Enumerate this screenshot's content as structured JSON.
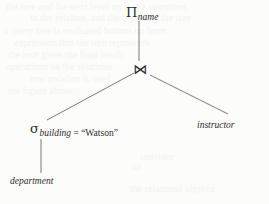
{
  "figure": {
    "kind": "relational-algebra-expression-tree",
    "ink_color": "#2e2e2e",
    "background_color": "#fcfcfb",
    "bleed_color": "#f4f4f2"
  },
  "nodes": {
    "project": {
      "symbol": "Π",
      "symbol_name": "pi-projection-symbol",
      "subscript": "name"
    },
    "join": {
      "symbol": "⋈",
      "symbol_name": "bowtie-natural-join-symbol",
      "subscript": ""
    },
    "select": {
      "symbol": "σ",
      "symbol_name": "sigma-selection-symbol",
      "subscript_attribute": "building",
      "subscript_operator": " = ",
      "subscript_value": "“Watson”"
    },
    "relation_instructor": {
      "label": "instructor"
    },
    "relation_department": {
      "label": "department"
    }
  },
  "edges": [
    {
      "name": "edge-project-to-join",
      "x1": 139,
      "y1": 21,
      "x2": 139,
      "y2": 61
    },
    {
      "name": "edge-join-to-select",
      "x1": 134,
      "y1": 73,
      "x2": 47,
      "y2": 120
    },
    {
      "name": "edge-join-to-instructor",
      "x1": 150,
      "y1": 75,
      "x2": 228,
      "y2": 114
    },
    {
      "name": "edge-select-to-department",
      "x1": 41,
      "y1": 139,
      "x2": 41,
      "y2": 173
    }
  ],
  "bleed_lines": [
    {
      "text": "the tree and the next level up is the operation",
      "x": 6,
      "y": 2
    },
    {
      "text": "in the relation, and the leaves of the tree",
      "x": 30,
      "y": 13
    },
    {
      "text": "a query tree is evaluated bottom up from",
      "x": 4,
      "y": 26
    },
    {
      "text": "expression that the tree represents",
      "x": 14,
      "y": 38
    },
    {
      "text": "the root gives the final result",
      "x": 8,
      "y": 50
    },
    {
      "text": "operations on the relations",
      "x": 6,
      "y": 62
    },
    {
      "text": "tree notation is used",
      "x": 30,
      "y": 74
    },
    {
      "text": "the figure above",
      "x": 8,
      "y": 86
    },
    {
      "text": "consider",
      "x": 140,
      "y": 152
    },
    {
      "text": "an",
      "x": 132,
      "y": 162
    },
    {
      "text": "the relational algebra",
      "x": 130,
      "y": 184
    }
  ]
}
